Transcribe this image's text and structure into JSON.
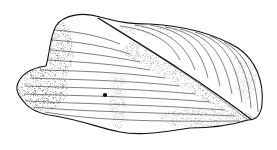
{
  "figure": {
    "style": "stipple and line drawing",
    "colors": {
      "background": "#ffffff",
      "ink": "#1a1a1a"
    }
  }
}
